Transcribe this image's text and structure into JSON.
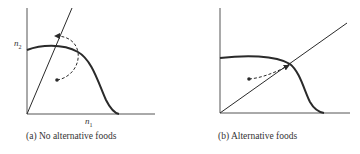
{
  "panels": [
    {
      "id": "a",
      "caption": "(a) No alternative foods",
      "x_axis_label": "n",
      "x_axis_sub": "1",
      "y_axis_label": "n",
      "y_axis_sub": "2",
      "elements": [
        "prey isocline (hump curve)",
        "predator isocline (steep line)",
        "dashed trajectory cycling away",
        "starting point"
      ]
    },
    {
      "id": "b",
      "caption": "(b) Alternative foods",
      "elements": [
        "prey isocline (hump curve)",
        "predator isocline (shallow line)",
        "dashed trajectory converging to intersection",
        "starting point"
      ]
    }
  ],
  "colors": {
    "ink": "#2a2a2a"
  }
}
